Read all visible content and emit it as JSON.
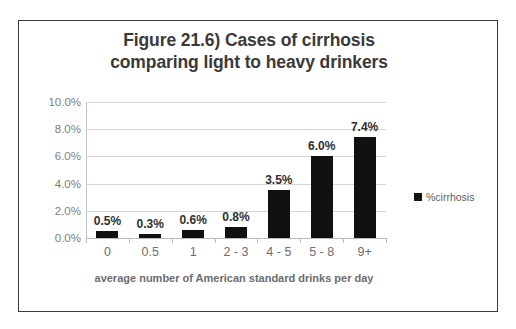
{
  "figure": {
    "title_line_1": "Figure 21.6) Cases of cirrhosis",
    "title_line_2": "comparing light to heavy drinkers"
  },
  "axes": {
    "y_tick_labels": [
      "10.0%",
      "8.0%",
      "6.0%",
      "4.0%",
      "2.0%",
      "0.0%"
    ],
    "x_axis_title": "average number of American standard drinks per day"
  },
  "legend": {
    "series_label": "%cirrhosis",
    "swatch_color": "#141414"
  },
  "bars": {
    "labels": [
      "0.5%",
      "0.3%",
      "0.6%",
      "0.8%",
      "3.5%",
      "6.0%",
      "7.4%"
    ],
    "categories": [
      "0",
      "0.5",
      "1",
      "2 - 3",
      "4 - 5",
      "5 - 8",
      "9+"
    ]
  },
  "chart_data": {
    "type": "bar",
    "title": "Figure 21.6) Cases of cirrhosis comparing light to heavy drinkers",
    "categories": [
      "0",
      "0.5",
      "1",
      "2 - 3",
      "4 - 5",
      "5 - 8",
      "9+"
    ],
    "values": [
      0.5,
      0.3,
      0.6,
      0.8,
      3.5,
      6.0,
      7.4
    ],
    "value_labels": [
      "0.5%",
      "0.3%",
      "0.6%",
      "0.8%",
      "3.5%",
      "6.0%",
      "7.4%"
    ],
    "series": [
      {
        "name": "%cirrhosis",
        "values": [
          0.5,
          0.3,
          0.6,
          0.8,
          3.5,
          6.0,
          7.4
        ],
        "color": "#111111"
      }
    ],
    "xlabel": "average number of American standard drinks per day",
    "ylabel": "",
    "ylim": [
      0,
      10
    ],
    "ytick_values": [
      0,
      2,
      4,
      6,
      8,
      10
    ],
    "ytick_labels": [
      "0.0%",
      "2.0%",
      "4.0%",
      "6.0%",
      "8.0%",
      "10.0%"
    ],
    "unit": "percent",
    "grid": "horizontal",
    "legend_position": "right",
    "legend_entries": [
      "%cirrhosis"
    ]
  }
}
